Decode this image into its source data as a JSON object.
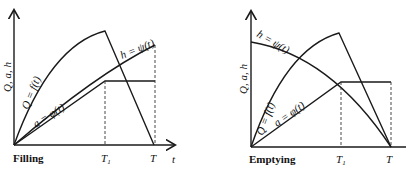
{
  "figure": {
    "left_panel": {
      "caption": "Filling",
      "y_axis_label": "Q, a, h",
      "x_axis_label": "t",
      "tick_T1": "T",
      "tick_T1_sub": "1",
      "tick_T": "T",
      "curves": {
        "Q": "Q = f(t)",
        "a": "a = φ(t)",
        "h": "h = ψ(t)"
      }
    },
    "right_panel": {
      "caption": "Emptying",
      "y_axis_label": "Q, a, h",
      "tick_T1": "T",
      "tick_T1_sub": "1",
      "tick_T": "T",
      "curves": {
        "Q": "Q = f(t)",
        "a": "a = φ(t)",
        "h": "h = ψ(t)"
      }
    }
  }
}
